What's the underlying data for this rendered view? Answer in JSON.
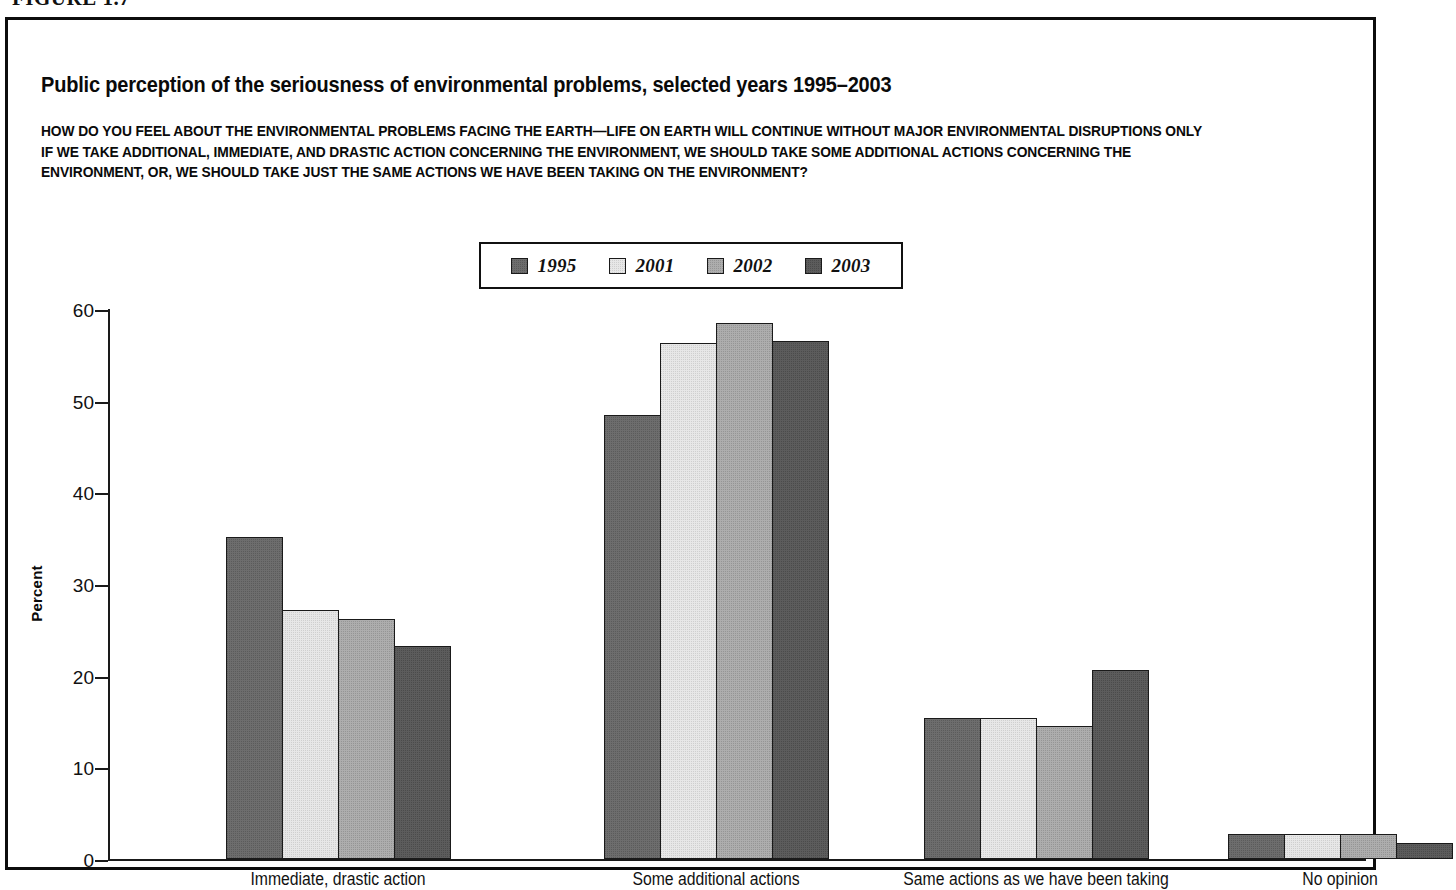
{
  "figure": {
    "number": "FIGURE 1.7"
  },
  "header": {
    "title": "Public perception of the seriousness of environmental problems, selected years 1995–2003",
    "question_lines": [
      "HOW DO YOU FEEL ABOUT THE ENVIRONMENTAL PROBLEMS FACING THE EARTH—LIFE ON EARTH WILL CONTINUE WITHOUT MAJOR ENVIRONMENTAL DISRUPTIONS ONLY",
      "IF WE TAKE ADDITIONAL, IMMEDIATE, AND DRASTIC ACTION CONCERNING THE ENVIRONMENT, WE SHOULD TAKE SOME ADDITIONAL ACTIONS CONCERNING THE",
      "ENVIRONMENT, OR, WE SHOULD TAKE JUST THE SAME ACTIONS WE HAVE BEEN TAKING ON THE ENVIRONMENT?"
    ]
  },
  "chart_data": {
    "type": "bar",
    "title": "Public perception of the seriousness of environmental problems, selected years 1995–2003",
    "xlabel": "",
    "ylabel": "Percent",
    "ylim": [
      0,
      60
    ],
    "yticks": [
      0,
      10,
      20,
      30,
      40,
      50,
      60
    ],
    "grid": false,
    "legend_position": "top-center",
    "categories": [
      "Immediate, drastic action",
      "Some additional actions",
      "Same actions as we have been taking",
      "No opinion"
    ],
    "series": [
      {
        "name": "1995",
        "color": "#6d6d6d",
        "values": [
          35.1,
          48.4,
          15.4,
          2.7
        ]
      },
      {
        "name": "2001",
        "color": "#e7e7e7",
        "values": [
          27.2,
          56.3,
          15.4,
          2.7
        ]
      },
      {
        "name": "2002",
        "color": "#adadad",
        "values": [
          26.2,
          58.5,
          14.5,
          2.7
        ]
      },
      {
        "name": "2003",
        "color": "#5c5c5c",
        "values": [
          23.2,
          56.5,
          20.6,
          1.8
        ]
      }
    ]
  }
}
